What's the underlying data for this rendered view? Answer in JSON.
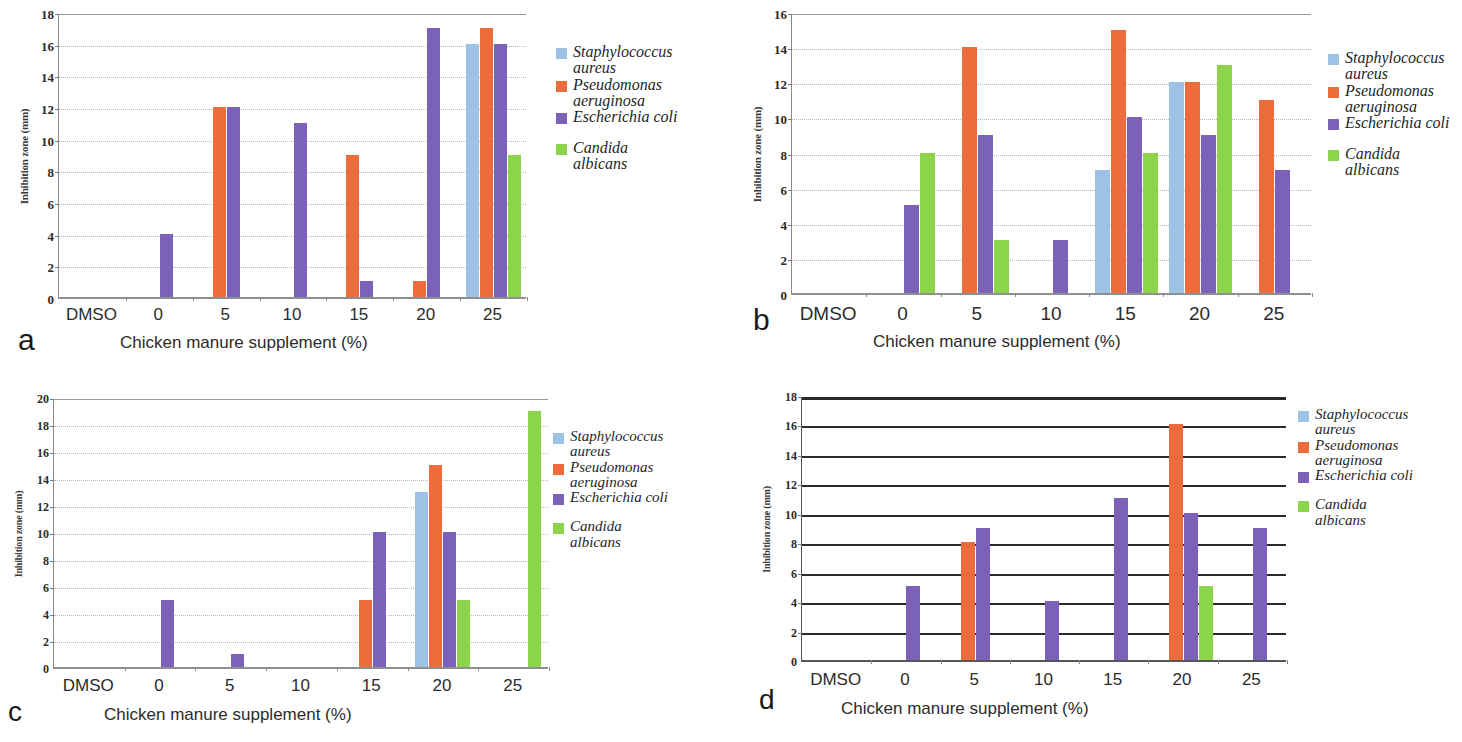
{
  "figure": {
    "axis_title_y": "Inhibition zone (mm)",
    "axis_title_x": "Chicken manure supplement (%)",
    "categories": [
      "DMSO",
      "0",
      "5",
      "10",
      "15",
      "20",
      "25"
    ],
    "series_names": [
      "Staphylococcus\naureus",
      "Pseudomonas\naeruginosa",
      "Escherichia coli",
      "Candida\nalbicans"
    ],
    "colors": {
      "staphylococcus": "#9CC3E5",
      "pseudomonas": "#ED6C3C",
      "escherichia": "#7B61B8",
      "candida": "#8CD44A"
    }
  },
  "panels": [
    {
      "id": "a",
      "letter": "a"
    },
    {
      "id": "b",
      "letter": "b"
    },
    {
      "id": "c",
      "letter": "c"
    },
    {
      "id": "d",
      "letter": "d"
    }
  ],
  "chart_data": [
    {
      "type": "bar",
      "panel": "a",
      "title": "",
      "xlabel": "Chicken manure supplement (%)",
      "ylabel": "Inhibition zone (mm)",
      "categories": [
        "DMSO",
        "0",
        "5",
        "10",
        "15",
        "20",
        "25"
      ],
      "ylim": [
        0,
        18
      ],
      "yticks": [
        0,
        2,
        4,
        6,
        8,
        10,
        12,
        14,
        16,
        18
      ],
      "grid": true,
      "grid_style": "dotted",
      "legend_position": "right",
      "series": [
        {
          "name": "Staphylococcus aureus",
          "color": "#9CC3E5",
          "values": [
            0,
            0,
            0,
            0,
            0,
            0,
            16
          ]
        },
        {
          "name": "Pseudomonas aeruginosa",
          "color": "#ED6C3C",
          "values": [
            0,
            0,
            12,
            0,
            9,
            1,
            17
          ]
        },
        {
          "name": "Escherichia coli",
          "color": "#7B61B8",
          "values": [
            0,
            4,
            12,
            11,
            1,
            17,
            16
          ]
        },
        {
          "name": "Candida albicans",
          "color": "#8CD44A",
          "values": [
            0,
            0,
            0,
            0,
            0,
            0,
            9
          ]
        }
      ]
    },
    {
      "type": "bar",
      "panel": "b",
      "title": "",
      "xlabel": "Chicken manure supplement (%)",
      "ylabel": "Inhibition zone (mm)",
      "categories": [
        "DMSO",
        "0",
        "5",
        "10",
        "15",
        "20",
        "25"
      ],
      "ylim": [
        0,
        16
      ],
      "yticks": [
        0,
        2,
        4,
        6,
        8,
        10,
        12,
        14,
        16
      ],
      "grid": true,
      "grid_style": "dotted",
      "legend_position": "right",
      "series": [
        {
          "name": "Staphylococcus aureus",
          "color": "#9CC3E5",
          "values": [
            0,
            0,
            0,
            0,
            7,
            12,
            0
          ]
        },
        {
          "name": "Pseudomonas aeruginosa",
          "color": "#ED6C3C",
          "values": [
            0,
            0,
            14,
            0,
            15,
            12,
            11
          ]
        },
        {
          "name": "Escherichia coli",
          "color": "#7B61B8",
          "values": [
            0,
            5,
            9,
            3,
            10,
            9,
            7
          ]
        },
        {
          "name": "Candida albicans",
          "color": "#8CD44A",
          "values": [
            0,
            8,
            3,
            0,
            8,
            13,
            0
          ]
        }
      ]
    },
    {
      "type": "bar",
      "panel": "c",
      "title": "",
      "xlabel": "Chicken manure supplement (%)",
      "ylabel": "Inhibition zone (mm)",
      "categories": [
        "DMSO",
        "0",
        "5",
        "10",
        "15",
        "20",
        "25"
      ],
      "ylim": [
        0,
        20
      ],
      "yticks": [
        0,
        2,
        4,
        6,
        8,
        10,
        12,
        14,
        16,
        18,
        20
      ],
      "grid": true,
      "grid_style": "dotted",
      "legend_position": "right",
      "series": [
        {
          "name": "Staphylococcus aureus",
          "color": "#9CC3E5",
          "values": [
            0,
            0,
            0,
            0,
            0,
            13,
            0
          ]
        },
        {
          "name": "Pseudomonas aeruginosa",
          "color": "#ED6C3C",
          "values": [
            0,
            0,
            0,
            0,
            5,
            15,
            0
          ]
        },
        {
          "name": "Escherichia coli",
          "color": "#7B61B8",
          "values": [
            0,
            5,
            1,
            0,
            10,
            10,
            0
          ]
        },
        {
          "name": "Candida albicans",
          "color": "#8CD44A",
          "values": [
            0,
            0,
            0,
            0,
            0,
            5,
            19
          ]
        }
      ]
    },
    {
      "type": "bar",
      "panel": "d",
      "title": "",
      "xlabel": "Chicken manure supplement (%)",
      "ylabel": "Inhibition zone (mm)",
      "categories": [
        "DMSO",
        "0",
        "5",
        "10",
        "15",
        "20",
        "25"
      ],
      "ylim": [
        0,
        18
      ],
      "yticks": [
        0,
        2,
        4,
        6,
        8,
        10,
        12,
        14,
        16,
        18
      ],
      "grid": true,
      "grid_style": "solid-dark",
      "legend_position": "right",
      "series": [
        {
          "name": "Staphylococcus aureus",
          "color": "#9CC3E5",
          "values": [
            0,
            0,
            0,
            0,
            0,
            0,
            0
          ]
        },
        {
          "name": "Pseudomonas aeruginosa",
          "color": "#ED6C3C",
          "values": [
            0,
            0,
            8,
            0,
            0,
            16,
            0
          ]
        },
        {
          "name": "Escherichia coli",
          "color": "#7B61B8",
          "values": [
            0,
            5,
            9,
            4,
            11,
            10,
            9
          ]
        },
        {
          "name": "Candida albicans",
          "color": "#8CD44A",
          "values": [
            0,
            0,
            0,
            0,
            0,
            5,
            0
          ]
        }
      ]
    }
  ],
  "layout": {
    "a": {
      "plot": {
        "left": 58,
        "top": 14,
        "width": 468,
        "height": 285
      },
      "ylabel_font": 11,
      "ytick_font": 13,
      "xtick_font": 17,
      "xlabel_font": 17,
      "xtick_y": 305,
      "xlabel_left": 120,
      "xlabel_top": 333,
      "letter_left": 18,
      "letter_top": 325,
      "letter_font": 30,
      "legend_left": 556,
      "legend_top": 44,
      "legend_font": 16,
      "legend_swatch": 11,
      "legend_gap": 4,
      "legend_spacer": 14,
      "bar_width": 13,
      "bar_gap": 1
    },
    "b": {
      "plot": {
        "left": 60,
        "top": 14,
        "width": 520,
        "height": 281
      },
      "ylabel_font": 11,
      "ytick_font": 13,
      "xtick_font": 19,
      "xlabel_font": 17,
      "xtick_y": 303,
      "xlabel_left": 142,
      "xlabel_top": 332,
      "letter_left": 22,
      "letter_top": 305,
      "letter_font": 30,
      "legend_left": 597,
      "legend_top": 50,
      "legend_font": 16,
      "legend_swatch": 11,
      "legend_gap": 4,
      "legend_spacer": 14,
      "bar_width": 15,
      "bar_gap": 1
    },
    "c": {
      "plot": {
        "left": 53,
        "top": 28,
        "width": 495,
        "height": 270
      },
      "ylabel_font": 10,
      "ytick_font": 12,
      "xtick_font": 17,
      "xlabel_font": 17,
      "xtick_y": 305,
      "xlabel_left": 104,
      "xlabel_top": 334,
      "letter_left": 8,
      "letter_top": 327,
      "letter_font": 28,
      "legend_left": 553,
      "legend_top": 58,
      "legend_font": 15,
      "legend_swatch": 11,
      "legend_gap": 4,
      "legend_spacer": 14,
      "bar_width": 13,
      "bar_gap": 1
    },
    "d": {
      "plot": {
        "left": 70,
        "top": 26,
        "width": 485,
        "height": 265
      },
      "ylabel_font": 10,
      "ytick_font": 12,
      "xtick_font": 17,
      "xlabel_font": 17,
      "xtick_y": 299,
      "xlabel_left": 110,
      "xlabel_top": 328,
      "letter_left": 28,
      "letter_top": 315,
      "letter_font": 28,
      "legend_left": 567,
      "legend_top": 36,
      "legend_font": 15,
      "legend_swatch": 11,
      "legend_gap": 4,
      "legend_spacer": 14,
      "bar_width": 14,
      "bar_gap": 1
    }
  }
}
